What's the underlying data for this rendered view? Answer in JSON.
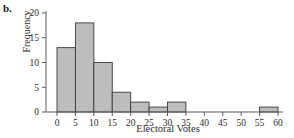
{
  "figure": {
    "panel_label": "b.",
    "background_color": "#ffffff"
  },
  "chart_data": {
    "type": "bar",
    "title": "",
    "subtitle": "",
    "xlabel": "Electoral Votes",
    "ylabel": "Frequency",
    "xlim": [
      0,
      60
    ],
    "ylim": [
      0,
      20
    ],
    "xticks": [
      0,
      5,
      10,
      15,
      20,
      25,
      30,
      35,
      40,
      45,
      50,
      55,
      60
    ],
    "xtick_labels": [
      "0",
      "5",
      "10",
      "15",
      "20",
      "25",
      "30",
      "35",
      "40",
      "45",
      "50",
      "55",
      "60"
    ],
    "yticks": [
      0,
      5,
      10,
      15,
      20
    ],
    "ytick_labels": [
      "0",
      "5",
      "10",
      "15",
      "20"
    ],
    "grid": false,
    "legend": null,
    "bin_width": 5,
    "bin_edges": [
      0,
      5,
      10,
      15,
      20,
      25,
      30,
      35,
      40,
      45,
      50,
      55,
      60
    ],
    "categories": [
      "0-5",
      "5-10",
      "10-15",
      "15-20",
      "20-25",
      "25-30",
      "30-35",
      "35-40",
      "40-45",
      "45-50",
      "50-55",
      "55-60"
    ],
    "values": [
      13,
      18,
      10,
      4,
      2,
      1,
      2,
      0,
      0,
      0,
      0,
      1
    ],
    "bar_fill_color": "#bdbdbd",
    "bar_edge_color": "#3a3a3a",
    "axis_color": "#5a5a5a"
  }
}
